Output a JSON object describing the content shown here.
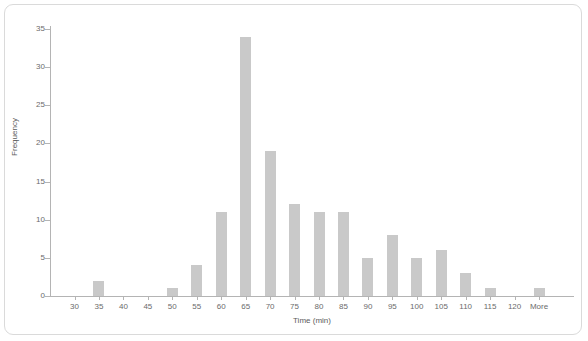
{
  "chart_data": {
    "type": "bar",
    "title": "",
    "subtitle": "",
    "xlabel": "Time (min)",
    "ylabel": "Frequency",
    "categories": [
      "30",
      "35",
      "40",
      "45",
      "50",
      "55",
      "60",
      "65",
      "70",
      "75",
      "80",
      "85",
      "90",
      "95",
      "100",
      "105",
      "110",
      "115",
      "120",
      "More"
    ],
    "values": [
      0,
      2,
      0,
      0,
      1,
      4,
      11,
      34,
      19,
      12,
      11,
      11,
      5,
      8,
      5,
      6,
      3,
      1,
      0,
      1
    ],
    "ylim": [
      0,
      36
    ],
    "yticks": [
      "0",
      "5",
      "10",
      "15",
      "20",
      "25",
      "30",
      "35"
    ],
    "ytick_values": [
      0,
      5,
      10,
      15,
      20,
      25,
      30,
      35
    ],
    "grid": false,
    "legend": false,
    "bar_color": "#c9c9c9",
    "axis_color": "#b4b4b4",
    "label_color": "#6b6b6b",
    "frame_color": "#dadada"
  }
}
